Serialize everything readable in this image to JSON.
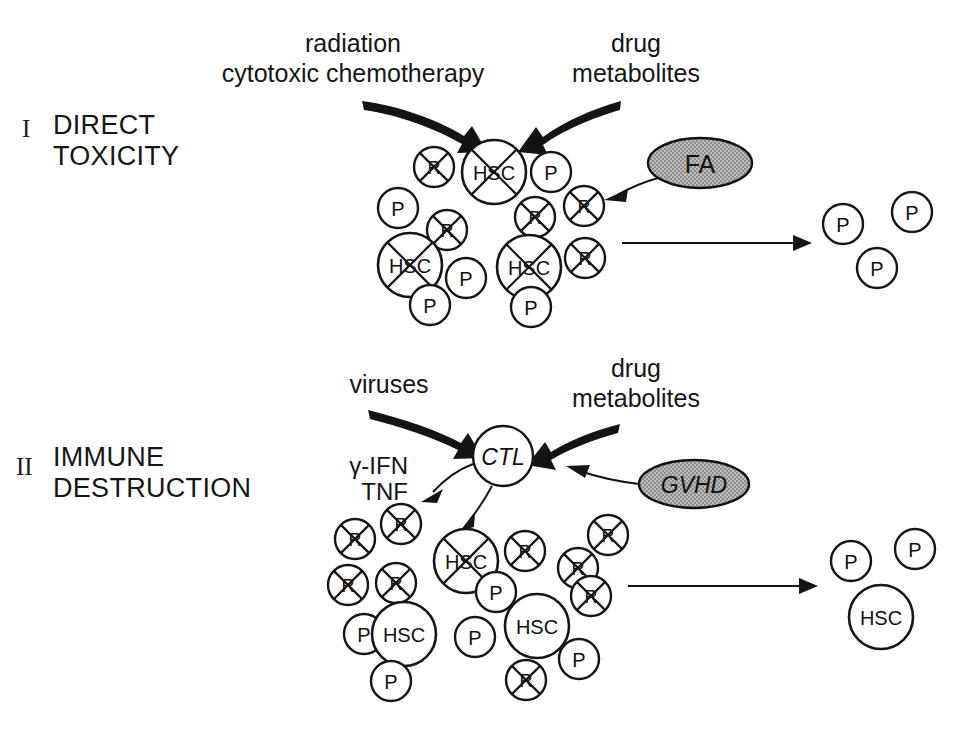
{
  "figure": {
    "background_color": "#ffffff",
    "ink_color": "#151515",
    "shade_color": "#a9a9a9"
  },
  "legend_keys": {
    "hsc": "HSC",
    "progenitor": "P",
    "r_cell": "R",
    "ctl": "CTL"
  },
  "panels": [
    {
      "id": "panel-1",
      "roman": "I",
      "title_line1": "DIRECT",
      "title_line2": "TOXICITY",
      "stimuli": [
        {
          "id": "stimulus-radiation",
          "line1": "radiation",
          "line2": "cytotoxic chemotherapy",
          "x": 353,
          "y": 52,
          "line_gap": 30
        },
        {
          "id": "stimulus-drug-metabolites",
          "line1": "drug",
          "line2": "metabolites",
          "x": 636,
          "y": 52,
          "line_gap": 30
        }
      ],
      "factor": {
        "id": "factor-fa",
        "label": "FA",
        "cx": 700,
        "cy": 163,
        "rx": 52,
        "ry": 25,
        "fill": "#a9a9a9"
      },
      "cells": [
        {
          "type": "R",
          "cx": 434,
          "cy": 167,
          "r": 20,
          "killed": true
        },
        {
          "type": "HSC",
          "cx": 494,
          "cy": 172,
          "r": 32,
          "killed": true
        },
        {
          "type": "P",
          "cx": 551,
          "cy": 172,
          "r": 20,
          "killed": false
        },
        {
          "type": "P",
          "cx": 398,
          "cy": 208,
          "r": 20,
          "killed": false
        },
        {
          "type": "R",
          "cx": 447,
          "cy": 230,
          "r": 20,
          "killed": true
        },
        {
          "type": "R",
          "cx": 535,
          "cy": 217,
          "r": 20,
          "killed": true
        },
        {
          "type": "R",
          "cx": 584,
          "cy": 206,
          "r": 20,
          "killed": true
        },
        {
          "type": "HSC",
          "cx": 410,
          "cy": 265,
          "r": 32,
          "killed": true
        },
        {
          "type": "P",
          "cx": 466,
          "cy": 278,
          "r": 20,
          "killed": false
        },
        {
          "type": "HSC",
          "cx": 529,
          "cy": 267,
          "r": 32,
          "killed": true
        },
        {
          "type": "R",
          "cx": 585,
          "cy": 258,
          "r": 20,
          "killed": true
        },
        {
          "type": "P",
          "cx": 430,
          "cy": 305,
          "r": 20,
          "killed": false
        },
        {
          "type": "P",
          "cx": 531,
          "cy": 307,
          "r": 20,
          "killed": false
        }
      ],
      "outcome_cells": [
        {
          "type": "P",
          "cx": 843,
          "cy": 224,
          "r": 20,
          "killed": false
        },
        {
          "type": "P",
          "cx": 912,
          "cy": 212,
          "r": 20,
          "killed": false
        },
        {
          "type": "P",
          "cx": 877,
          "cy": 268,
          "r": 20,
          "killed": false
        }
      ],
      "outcome_arrow": {
        "x1": 622,
        "y1": 243,
        "x2": 800,
        "y2": 243
      }
    },
    {
      "id": "panel-2",
      "roman": "II",
      "title_line1": "IMMUNE",
      "title_line2": "DESTRUCTION",
      "stimuli": [
        {
          "id": "stimulus-viruses",
          "line1": "viruses",
          "line2": "",
          "x": 389,
          "y": 393,
          "line_gap": 30
        },
        {
          "id": "stimulus-drug-metabolites-2",
          "line1": "drug",
          "line2": "metabolites",
          "x": 636,
          "y": 377,
          "line_gap": 30
        }
      ],
      "factor": {
        "id": "factor-gvhd",
        "label": "GVHD",
        "cx": 694,
        "cy": 484,
        "rx": 55,
        "ry": 24,
        "fill": "#a9a9a9"
      },
      "ctl": {
        "id": "cell-ctl",
        "label": "CTL",
        "cx": 503,
        "cy": 456,
        "r": 30
      },
      "cytokines": {
        "id": "cytokine-labels",
        "line1": "γ-IFN",
        "line2": "TNF",
        "x": 408,
        "y": 474,
        "line_gap": 26
      },
      "cells": [
        {
          "type": "R",
          "cx": 355,
          "cy": 539,
          "r": 20,
          "killed": true
        },
        {
          "type": "R",
          "cx": 401,
          "cy": 524,
          "r": 20,
          "killed": true
        },
        {
          "type": "HSC",
          "cx": 466,
          "cy": 561,
          "r": 32,
          "killed": true
        },
        {
          "type": "R",
          "cx": 525,
          "cy": 551,
          "r": 20,
          "killed": true
        },
        {
          "type": "R",
          "cx": 578,
          "cy": 568,
          "r": 20,
          "killed": true
        },
        {
          "type": "R",
          "cx": 608,
          "cy": 535,
          "r": 20,
          "killed": true
        },
        {
          "type": "R",
          "cx": 348,
          "cy": 585,
          "r": 20,
          "killed": true
        },
        {
          "type": "R",
          "cx": 396,
          "cy": 583,
          "r": 20,
          "killed": true
        },
        {
          "type": "P",
          "cx": 496,
          "cy": 592,
          "r": 20,
          "killed": false
        },
        {
          "type": "R",
          "cx": 591,
          "cy": 596,
          "r": 20,
          "killed": true
        },
        {
          "type": "P",
          "cx": 364,
          "cy": 634,
          "r": 20,
          "killed": false
        },
        {
          "type": "HSC",
          "cx": 404,
          "cy": 634,
          "r": 32,
          "killed": false
        },
        {
          "type": "P",
          "cx": 475,
          "cy": 637,
          "r": 20,
          "killed": false
        },
        {
          "type": "HSC",
          "cx": 537,
          "cy": 626,
          "r": 32,
          "killed": false
        },
        {
          "type": "P",
          "cx": 579,
          "cy": 659,
          "r": 20,
          "killed": false
        },
        {
          "type": "P",
          "cx": 391,
          "cy": 681,
          "r": 20,
          "killed": false
        },
        {
          "type": "R",
          "cx": 526,
          "cy": 680,
          "r": 20,
          "killed": true
        }
      ],
      "outcome_cells": [
        {
          "type": "P",
          "cx": 851,
          "cy": 561,
          "r": 20,
          "killed": false
        },
        {
          "type": "P",
          "cx": 915,
          "cy": 549,
          "r": 20,
          "killed": false
        },
        {
          "type": "HSC",
          "cx": 881,
          "cy": 617,
          "r": 32,
          "killed": false
        }
      ],
      "outcome_arrow": {
        "x1": 628,
        "y1": 586,
        "x2": 806,
        "y2": 586
      }
    }
  ]
}
